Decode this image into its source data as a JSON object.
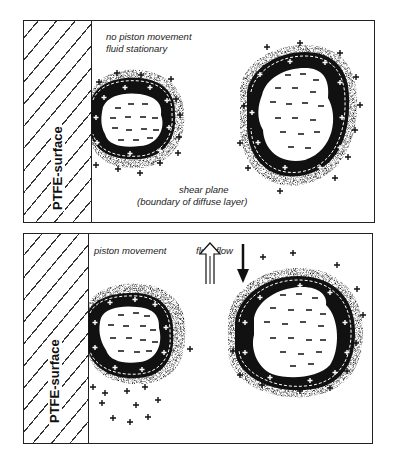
{
  "top_panel": {
    "surface_label": "PTFE-surface",
    "caption_line1": "no piston movement",
    "caption_line2": "fluid stationary",
    "shear_line1": "shear plane",
    "shear_line2": "(boundary of diffuse layer)"
  },
  "bottom_panel": {
    "surface_label": "PTFE-surface",
    "piston_label": "piston movement",
    "flow_label": "fluid flow"
  },
  "symbols": {
    "positive": "+",
    "negative": "−"
  },
  "colors": {
    "ink": "#111111",
    "background": "#ffffff"
  }
}
